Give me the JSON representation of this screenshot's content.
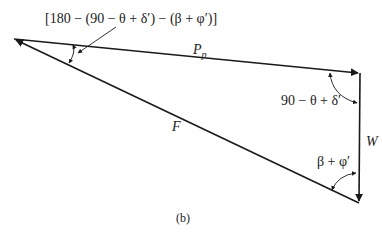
{
  "figure": {
    "caption": "(b)",
    "type": "force polygon",
    "vertices": {
      "left": [
        14,
        39
      ],
      "top_right": [
        360,
        73
      ],
      "bottom": [
        359,
        203
      ]
    },
    "forces": [
      {
        "name": "P_p",
        "label": "P",
        "subscript": "p"
      },
      {
        "name": "W",
        "label": "W"
      },
      {
        "name": "F",
        "label": "F"
      }
    ],
    "angles": {
      "left": "[180 − (90 − θ + δ′) − (β + φ′)]",
      "top_right": "90 − θ + δ′",
      "bottom": "β + φ′"
    },
    "colors": {
      "line": "#1a1a1a",
      "background": "#ffffff"
    }
  }
}
